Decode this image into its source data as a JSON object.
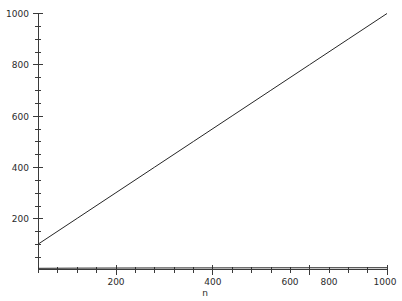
{
  "chart_data": {
    "type": "line",
    "title": "",
    "subtitle": "",
    "xlabel": "n",
    "ylabel": "",
    "xlim": [
      100,
      1000
    ],
    "ylim": [
      0,
      1000
    ],
    "grid": false,
    "legend": "none",
    "x_ticks": [
      200,
      400,
      600,
      800,
      1000
    ],
    "x_tick_labels": [
      "200",
      "400",
      "600",
      "800",
      "1000"
    ],
    "x_minor_step": 50,
    "y_ticks": [
      200,
      400,
      600,
      800,
      1000
    ],
    "y_tick_labels": [
      "200",
      "400",
      "600",
      "800",
      "1000"
    ],
    "y_minor_step": 50,
    "x": [
      100,
      200,
      300,
      400,
      500,
      600,
      700,
      800,
      900,
      1000
    ],
    "series": [
      {
        "name": "n",
        "color": "#262626",
        "values": [
          100,
          200,
          300,
          400,
          500,
          600,
          700,
          800,
          900,
          1000
        ]
      },
      {
        "name": "log(n)",
        "color": "#262626",
        "values": [
          4.6,
          5.3,
          5.7,
          6.0,
          6.2,
          6.4,
          6.6,
          6.7,
          6.8,
          6.9
        ]
      }
    ]
  },
  "axis": {
    "x_label": "n",
    "y_label": ""
  },
  "labels": {
    "y_1000": "1000",
    "y_800": "800",
    "y_600": "600",
    "y_400": "400",
    "y_200": "200",
    "x_200": "200",
    "x_400": "400",
    "x_600": "600",
    "x_800": "800",
    "x_1000": "1000"
  },
  "colors": {
    "background": "#ffffff",
    "axis": "#3a3a3a",
    "text": "#2b2b2b",
    "series": "#262626"
  }
}
